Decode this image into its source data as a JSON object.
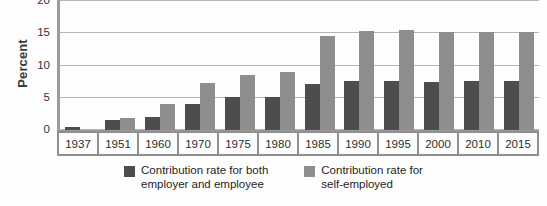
{
  "chart_data": {
    "type": "bar",
    "title": "",
    "subtitle": "",
    "xlabel": "",
    "ylabel": "Percent",
    "ylim": [
      0,
      20
    ],
    "yticks": [
      0,
      5,
      10,
      15,
      20
    ],
    "grid": true,
    "legend_position": "bottom",
    "categories": [
      "1937",
      "1951",
      "1960",
      "1970",
      "1975",
      "1980",
      "1985",
      "1990",
      "1995",
      "2000",
      "2010",
      "2015"
    ],
    "series": [
      {
        "name": "Contribution rate for both\nemployer and employee",
        "color": "#4d4d4d",
        "values": [
          0.4,
          1.5,
          2.0,
          4.0,
          5.1,
          5.1,
          7.2,
          7.65,
          7.65,
          7.5,
          7.65,
          7.65
        ]
      },
      {
        "name": "Contribution rate for\nself-employed",
        "color": "#8d8d8d",
        "values": [
          0.0,
          1.8,
          4.0,
          7.3,
          8.5,
          9.0,
          14.5,
          15.3,
          15.5,
          15.2,
          15.2,
          15.2
        ]
      }
    ],
    "annotations": []
  },
  "axis": {
    "y_title": "Percent",
    "tick_labels": [
      "20",
      "15",
      "10",
      "5",
      "0"
    ]
  },
  "colors": {
    "series_dark": "#4d4d4d",
    "series_light": "#8d8d8d",
    "gridline": "#b5b5b5",
    "axis": "#9a9a9a",
    "background": "#fdfdfd"
  }
}
